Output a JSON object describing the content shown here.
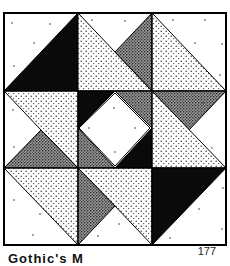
{
  "figure": {
    "grid": "3x3 nine-patch",
    "fills": {
      "white": "#ffffff",
      "black": "#0a0a0a",
      "light_stipple": "light dotted",
      "dark_stipple": "dense dotted"
    }
  },
  "caption": {
    "label": "Gothic's M",
    "page_number": "177"
  }
}
